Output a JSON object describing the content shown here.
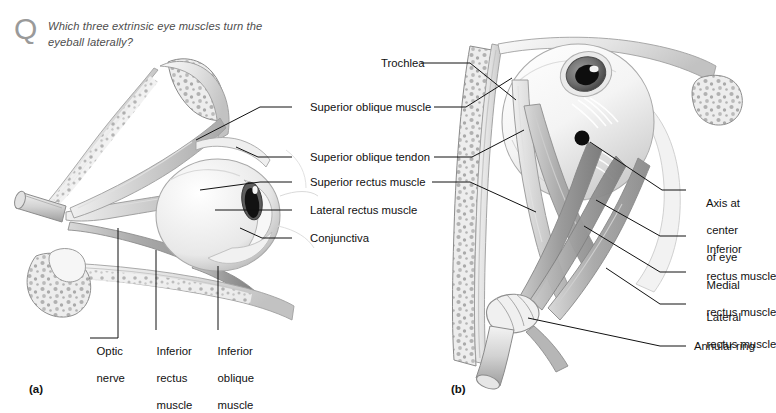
{
  "figure": {
    "question": {
      "icon": "question-mark-q",
      "text": "Which three extrinsic eye muscles turn the eyeball laterally?"
    },
    "panels": [
      {
        "id": "a",
        "caption": "(a)",
        "view": "lateral view of right orbit"
      },
      {
        "id": "b",
        "caption": "(b)",
        "view": "superior view of right orbit"
      }
    ],
    "center_labels": [
      {
        "text": "Superior oblique muscle"
      },
      {
        "text": "Superior oblique tendon"
      },
      {
        "text": "Superior rectus muscle"
      },
      {
        "text": "Lateral rectus muscle"
      },
      {
        "text": "Conjunctiva"
      }
    ],
    "left_bottom_labels": [
      {
        "line1": "Optic",
        "line2": "nerve",
        "line3": ""
      },
      {
        "line1": "Inferior",
        "line2": "rectus",
        "line3": "muscle"
      },
      {
        "line1": "Inferior",
        "line2": "oblique",
        "line3": "muscle"
      }
    ],
    "top_label": {
      "text": "Trochlea"
    },
    "right_labels": [
      {
        "line1": "Axis at",
        "line2": "center",
        "line3": "of eye"
      },
      {
        "line1": "Inferior",
        "line2": "rectus muscle",
        "line3": ""
      },
      {
        "line1": "Medial",
        "line2": "rectus muscle",
        "line3": ""
      },
      {
        "line1": "Lateral",
        "line2": "rectus muscle",
        "line3": ""
      },
      {
        "line1": "Annular ring",
        "line2": "",
        "line3": ""
      }
    ],
    "colors": {
      "ink": "#111111",
      "question_text": "#4d4d4d",
      "q_icon": "#9a9a9a",
      "background": "#ffffff",
      "bone_light": "#f2f2f2",
      "muscle_mid": "#b9b9b9",
      "shadow": "#8d8d8d"
    }
  }
}
